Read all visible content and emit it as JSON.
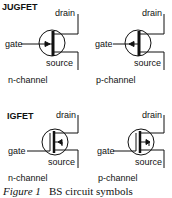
{
  "sections": [
    {
      "title": "JUGFET",
      "symbols": [
        {
          "channel": "n-channel",
          "labels": {
            "drain": "drain",
            "gate": "gate",
            "source": "source"
          },
          "arrow": "inward"
        },
        {
          "channel": "p-channel",
          "labels": {
            "drain": "drain",
            "gate": "gate",
            "source": "source"
          },
          "arrow": "outward"
        }
      ]
    },
    {
      "title": "IGFET",
      "symbols": [
        {
          "channel": "n-channel",
          "labels": {
            "drain": "drain",
            "gate": "gate",
            "source": "source"
          },
          "arrow": "inward"
        },
        {
          "channel": "p-channel",
          "labels": {
            "drain": "drain",
            "gate": "gate",
            "source": "source"
          },
          "arrow": "outward"
        }
      ]
    }
  ],
  "caption": {
    "figure": "Figure 1",
    "text": "BS circuit symbols"
  },
  "colors": {
    "stroke": "#111111",
    "background": "#ffffff"
  }
}
